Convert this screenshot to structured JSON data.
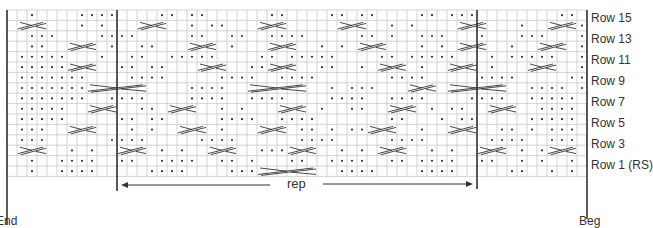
{
  "chart": {
    "columns": 58,
    "rows_count": 16,
    "grid_left": 7,
    "grid_top": 10,
    "cell_w": 10.0,
    "cell_h": 10.4,
    "row_labels": [
      {
        "row": 15,
        "label": "Row 15"
      },
      {
        "row": 13,
        "label": "Row 13"
      },
      {
        "row": 11,
        "label": "Row 11"
      },
      {
        "row": 9,
        "label": "Row 9"
      },
      {
        "row": 7,
        "label": "Row 7"
      },
      {
        "row": 5,
        "label": "Row 5"
      },
      {
        "row": 3,
        "label": "Row 3"
      },
      {
        "row": 1,
        "label": "Row 1 (RS)"
      }
    ],
    "rep_label": "rep",
    "rep_start_col": 11,
    "rep_end_col": 47,
    "end_label": "End",
    "beg_label": "Beg",
    "colors": {
      "grid": "#c8c8c8",
      "ink": "#333333",
      "bg": "#ffffff"
    },
    "pattern": [
      "..*....****....**.**......**....**.**....**.***........**.",
      ".XXX...*.*...XXX..*.**...XXX.....XXX..*.*....XXX...*..XXX*",
      "..***....****.....**..**..****.....**.*..***...*...***...*",
      "..**..XXX.*..**...XXX.*...XXX..*.*.XXX...*.*.XXX..*..XXX.*",
      ".*****...*..**..*****....**.*****....**.*****...*.*****..*",
      ".*****XXX..**.**...XXX..**XXX..**..*.XXX.*..XXX.*...XXX..*",
      ".*******....****.....****..****.......****.....****.....**",
      ".*******XXXXXX....****..XXXXXX..*.***...XXX.XXXXXX..****.*",
      ".*******..****....****..****....****..****....****..*****",
      ".*****..XXX..**.XXX..*.*...XXX.*..**..XXX.*.**..XXX..****",
      ".*****.....**.**.....****..****.......**...*.**.....*****",
      ".***..XXX...*.*..XXX.*...XXX.**.*.**XXX..*..XXX..**.*.***",
      ".***......****.....****......****.....****......****..***",
      ".XXX..*.*..XXX.*.*..XXX..***XXX..*.*.XXX..*.*..XXX.*.*XXX",
      "..*..****..**..****..**.*...**..****..**.****..**..*.*..*",
      "..*..****.....****....***XXXXXX..****....****.....**..*.*"
    ]
  }
}
